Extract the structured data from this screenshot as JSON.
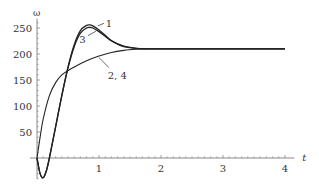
{
  "chart_data": {
    "type": "line",
    "title": "",
    "xlabel": "t",
    "ylabel": "ω",
    "xlim": [
      0,
      4
    ],
    "ylim": [
      -40,
      270
    ],
    "x_ticks": [
      "1",
      "2",
      "3",
      "4"
    ],
    "y_ticks": [
      "50",
      "100",
      "150",
      "200",
      "250"
    ],
    "grid": false,
    "legend": "inline curve labels",
    "series": [
      {
        "name": "1",
        "x": [
          0,
          0.05,
          0.1,
          0.15,
          0.2,
          0.3,
          0.4,
          0.5,
          0.6,
          0.7,
          0.8,
          0.85,
          0.9,
          1.0,
          1.1,
          1.2,
          1.4,
          1.6,
          1.8,
          2.0,
          3.0,
          4.0
        ],
        "y": [
          0,
          -30,
          -38,
          -25,
          0,
          60,
          120,
          175,
          218,
          245,
          255,
          256,
          254,
          246,
          236,
          226,
          215,
          211,
          210,
          210,
          210,
          210
        ]
      },
      {
        "name": "3",
        "x": [
          0,
          0.05,
          0.1,
          0.15,
          0.2,
          0.3,
          0.4,
          0.5,
          0.6,
          0.7,
          0.8,
          0.85,
          0.9,
          1.0,
          1.1,
          1.2,
          1.4,
          1.6,
          1.8,
          2.0,
          3.0,
          4.0
        ],
        "y": [
          0,
          -30,
          -38,
          -25,
          0,
          60,
          120,
          173,
          214,
          240,
          250,
          251,
          250,
          243,
          234,
          225,
          214,
          211,
          210,
          210,
          210,
          210
        ]
      },
      {
        "name": "2, 4",
        "x": [
          0,
          0.05,
          0.1,
          0.2,
          0.3,
          0.4,
          0.5,
          0.6,
          0.8,
          1.0,
          1.2,
          1.4,
          1.6,
          1.8,
          2.0,
          3.0,
          4.0
        ],
        "y": [
          0,
          40,
          75,
          120,
          145,
          160,
          168,
          175,
          187,
          196,
          203,
          207,
          209,
          210,
          210,
          210,
          210
        ]
      }
    ],
    "annotations": [
      {
        "text": "1",
        "x": 1.1,
        "y": 262
      },
      {
        "text": "3",
        "x": 0.75,
        "y": 228
      },
      {
        "text": "2, 4",
        "x": 1.25,
        "y": 160
      }
    ]
  }
}
